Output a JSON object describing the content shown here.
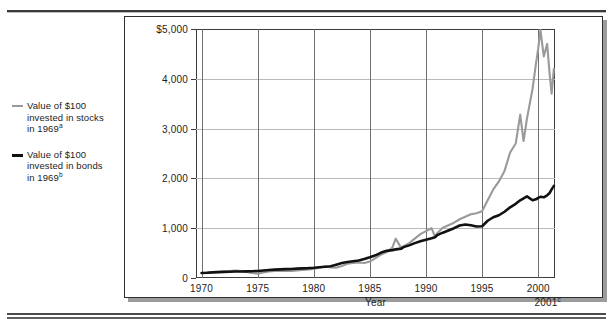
{
  "figure": {
    "legend": [
      {
        "name": "stocks",
        "color": "#9a9a9a",
        "line1": "Value of $100",
        "line2": "invested in stocks",
        "line3": "in 1969",
        "note": "a"
      },
      {
        "name": "bonds",
        "color": "#111111",
        "line1": "Value of $100",
        "line2": "invested in bonds",
        "line3": "in 1969",
        "note": "b"
      }
    ],
    "end_label": "2001",
    "end_label_note": "c"
  },
  "chart_data": {
    "type": "line",
    "title": "",
    "xlabel": "Year",
    "ylabel": "",
    "xlim": [
      1969.5,
      2001.5
    ],
    "ylim": [
      0,
      5000
    ],
    "grid": true,
    "legend_position": "left-outside",
    "ytick_labels": [
      "$5,000",
      "4,000",
      "3,000",
      "2,000",
      "1,000",
      "0"
    ],
    "ytick_values": [
      5000,
      4000,
      3000,
      2000,
      1000,
      0
    ],
    "xtick_labels": [
      "1970",
      "1975",
      "1980",
      "1985",
      "1990",
      "1995",
      "2000"
    ],
    "xtick_values": [
      1970,
      1975,
      1980,
      1985,
      1990,
      1995,
      2000
    ],
    "x": [
      1970,
      1970.5,
      1971,
      1971.5,
      1972,
      1972.5,
      1973,
      1973.5,
      1974,
      1974.5,
      1975,
      1975.5,
      1976,
      1976.5,
      1977,
      1977.5,
      1978,
      1978.5,
      1979,
      1979.5,
      1980,
      1980.5,
      1981,
      1981.5,
      1982,
      1982.5,
      1983,
      1983.5,
      1984,
      1984.5,
      1985,
      1985.5,
      1986,
      1986.5,
      1987,
      1987.3,
      1987.8,
      1988,
      1988.5,
      1989,
      1989.5,
      1990,
      1990.5,
      1990.8,
      1991,
      1991.5,
      1992,
      1992.5,
      1993,
      1993.5,
      1994,
      1994.5,
      1995,
      1995.5,
      1996,
      1996.5,
      1997,
      1997.5,
      1998,
      1998.4,
      1998.7,
      1999,
      1999.5,
      1999.8,
      2000,
      2000.2,
      2000.5,
      2000.8,
      2001,
      2001.2,
      2001.4
    ],
    "series": [
      {
        "name": "Value of $100 invested in stocks in 1969",
        "color": "#9a9a9a",
        "values": [
          100,
          108,
          118,
          126,
          132,
          140,
          150,
          138,
          120,
          100,
          88,
          112,
          132,
          142,
          148,
          140,
          142,
          152,
          160,
          172,
          182,
          208,
          230,
          212,
          205,
          240,
          285,
          300,
          310,
          300,
          330,
          400,
          470,
          520,
          610,
          790,
          600,
          640,
          700,
          790,
          880,
          940,
          1000,
          830,
          900,
          1010,
          1060,
          1110,
          1180,
          1230,
          1280,
          1300,
          1340,
          1560,
          1780,
          1940,
          2150,
          2520,
          2700,
          3280,
          2750,
          3200,
          3800,
          4300,
          4600,
          4980,
          4450,
          4700,
          4150,
          3700,
          4200
        ]
      },
      {
        "name": "Value of $100 invested in bonds in 1969",
        "color": "#111111",
        "values": [
          100,
          104,
          112,
          118,
          122,
          126,
          130,
          132,
          134,
          136,
          142,
          150,
          160,
          168,
          174,
          178,
          182,
          188,
          194,
          198,
          205,
          215,
          226,
          236,
          268,
          300,
          320,
          335,
          352,
          380,
          415,
          455,
          510,
          545,
          560,
          575,
          590,
          620,
          655,
          700,
          740,
          770,
          800,
          820,
          860,
          910,
          955,
          1000,
          1055,
          1075,
          1060,
          1035,
          1040,
          1150,
          1220,
          1260,
          1330,
          1420,
          1490,
          1560,
          1600,
          1640,
          1560,
          1580,
          1610,
          1630,
          1620,
          1660,
          1700,
          1780,
          1850
        ]
      }
    ]
  }
}
